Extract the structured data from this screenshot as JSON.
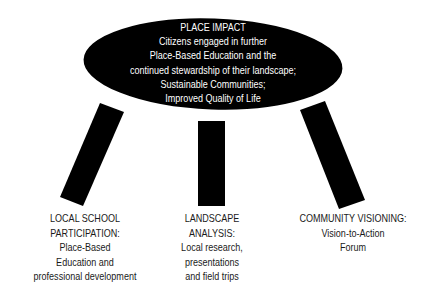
{
  "diagram": {
    "title": "PLACE IMPACT",
    "top": {
      "lines": [
        "PLACE IMPACT",
        "Citizens engaged in further",
        "Place-Based Education and the",
        "continued stewardship of their landscape;",
        "Sustainable Communities;",
        "Improved Quality of Life"
      ]
    },
    "legs": [
      {
        "name": "local-school-participation",
        "lines": [
          "LOCAL SCHOOL",
          "PARTICIPATION:",
          "Place-Based",
          "Education and",
          "professional development"
        ]
      },
      {
        "name": "landscape-analysis",
        "lines": [
          "LANDSCAPE",
          "ANALYSIS:",
          "Local research,",
          "presentations",
          "and field trips"
        ]
      },
      {
        "name": "community-visioning",
        "lines": [
          "COMMUNITY VISIONING:",
          "Vision-to-Action",
          "Forum"
        ]
      }
    ],
    "colors": {
      "shape_fill": "#000000",
      "background": "#ffffff",
      "ellipse_text": "#ffffff",
      "label_text": "#1a1a1a"
    }
  }
}
